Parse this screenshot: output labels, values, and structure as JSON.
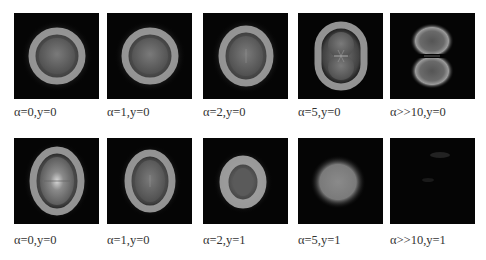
{
  "figure": {
    "rows": [
      {
        "panels": [
          {
            "label": "α=0,y=0",
            "pattern": "ring-round"
          },
          {
            "label": "α=1,y=0",
            "pattern": "ring-round"
          },
          {
            "label": "α=2,y=0",
            "pattern": "ring-slight-oval"
          },
          {
            "label": "α=5,y=0",
            "pattern": "ring-peanut"
          },
          {
            "label": "α>>10,y=0",
            "pattern": "double-lobe"
          }
        ]
      },
      {
        "panels": [
          {
            "label": "α=0,y=0",
            "pattern": "ring-tall-oval-bright"
          },
          {
            "label": "α=1,y=0",
            "pattern": "ring-tall-oval"
          },
          {
            "label": "α=2,y=1",
            "pattern": "ring-small-oval"
          },
          {
            "label": "α=5,y=1",
            "pattern": "filled-spot"
          },
          {
            "label": "α>>10,y=1",
            "pattern": "near-dark"
          }
        ]
      }
    ]
  }
}
